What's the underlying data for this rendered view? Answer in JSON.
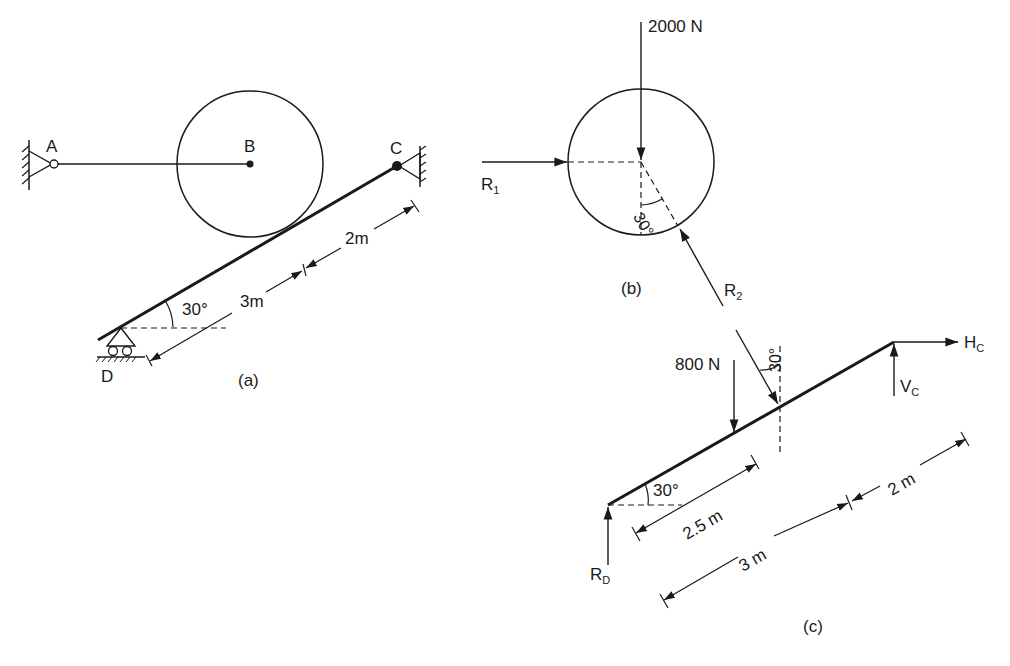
{
  "figure": {
    "panels": [
      {
        "id": "a",
        "caption": "(a)"
      },
      {
        "id": "b",
        "caption": "(b)"
      },
      {
        "id": "c",
        "caption": "(c)"
      }
    ]
  },
  "panel_a": {
    "points": {
      "A": "A",
      "B": "B",
      "C": "C",
      "D": "D"
    },
    "angle": "30°",
    "dim_lower": "3m",
    "dim_upper": "2m",
    "caption": "(a)"
  },
  "panel_b": {
    "load": "2000 N",
    "reaction1": "R",
    "reaction1_sub": "1",
    "reaction2": "R",
    "reaction2_sub": "2",
    "angle": "30°",
    "caption": "(b)"
  },
  "panel_c": {
    "load": "800 N",
    "angle_incline": "30°",
    "angle_force": "30°",
    "horizontal_reaction": "H",
    "horizontal_reaction_sub": "C",
    "vertical_reaction": "V",
    "vertical_reaction_sub": "C",
    "support_reaction": "R",
    "support_reaction_sub": "D",
    "dim_load": "2.5 m",
    "dim_lower": "3 m",
    "dim_upper": "2 m",
    "caption": "(c)"
  },
  "colors": {
    "ink": "#1a1a1a",
    "background": "#ffffff"
  }
}
